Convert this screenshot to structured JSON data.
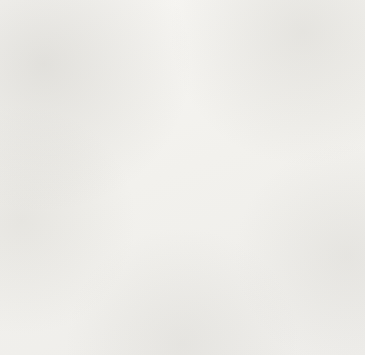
{
  "worksheet": {
    "title": "Decimal Shading Grids",
    "grid_rows": 10,
    "grid_cols": 10,
    "total_cells": 100,
    "ink_color": "#100f0e",
    "paper_color": "#f4f3f0",
    "gridline_color": "#53504c",
    "border_color": "#22201e"
  },
  "panels": [
    {
      "id": "panel-1",
      "position": "top-left",
      "label": ".06",
      "shaded_cells": 6,
      "decimal_value": 0.06,
      "percent": 6,
      "fraction": "6/100",
      "shading_description": "One column wide, bottom 6 rows of column 1",
      "filled_columns": 0,
      "partial_column_index": 1,
      "partial_column_rows": 6,
      "partial_column_anchor": "bottom"
    },
    {
      "id": "panel-2",
      "position": "top-right",
      "label": ".42",
      "shaded_cells": 42,
      "decimal_value": 0.42,
      "percent": 42,
      "fraction": "42/100",
      "shading_description": "Four full columns plus bottom 2 rows of column 5",
      "filled_columns": 4,
      "partial_column_index": 5,
      "partial_column_rows": 2,
      "partial_column_anchor": "bottom"
    },
    {
      "id": "panel-3",
      "position": "bottom-left",
      "label": ".64",
      "shaded_cells": 64,
      "decimal_value": 0.64,
      "percent": 64,
      "fraction": "64/100",
      "shading_description": "Six full columns plus bottom 4 rows of column 7",
      "filled_columns": 6,
      "partial_column_index": 7,
      "partial_column_rows": 4,
      "partial_column_anchor": "bottom"
    },
    {
      "id": "panel-4",
      "position": "bottom-right",
      "label": ".98",
      "shaded_cells": 98,
      "decimal_value": 0.98,
      "percent": 98,
      "fraction": "98/100",
      "shading_description": "Nine full columns plus bottom 8 rows of column 10; top 2 cells of column 10 left white",
      "filled_columns": 9,
      "partial_column_index": 10,
      "partial_column_rows": 8,
      "partial_column_anchor": "bottom"
    }
  ],
  "chart_data": {
    "type": "bar",
    "subtitle": "Four 10x10 hundred-grids with shaded fractions",
    "categories": [
      ".06",
      ".42",
      ".64",
      ".98"
    ],
    "values": [
      0.06,
      0.42,
      0.64,
      0.98
    ],
    "counts": [
      6,
      42,
      64,
      98
    ],
    "xlabel": "",
    "ylabel": "Shaded fraction of 100 cells",
    "ylim": [
      0,
      1
    ],
    "grid": true,
    "legend": "none"
  }
}
